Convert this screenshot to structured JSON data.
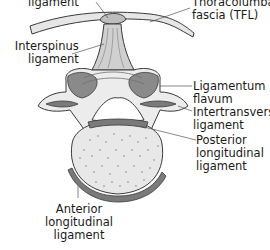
{
  "diagram": {
    "colors": {
      "bone": "#ececec",
      "bone_outline": "#3a3a3a",
      "ligament": "#8a8a8a",
      "ligament_dark": "#6e6e6e",
      "fascia": "#e6e6e6",
      "body_speckle": "#a8a8a8",
      "leader_line": "#555555",
      "text": "#1a1a1a"
    },
    "labels": {
      "supraspinous": {
        "lines": [
          "ligament"
        ]
      },
      "tfl": {
        "lines": [
          "Thoracolumbar",
          "fascia (TFL)"
        ]
      },
      "interspinus": {
        "lines": [
          "Interspinus",
          "ligament"
        ]
      },
      "flavum": {
        "lines": [
          "Ligamentum",
          "flavum"
        ]
      },
      "intertransverse": {
        "lines": [
          "Intertransverse",
          "ligament"
        ]
      },
      "posterior_longitudinal": {
        "lines": [
          "Posterior",
          "longitudinal",
          "ligament"
        ]
      },
      "anterior_longitudinal": {
        "lines": [
          "Anterior",
          "longitudinal",
          "ligament"
        ]
      }
    }
  }
}
